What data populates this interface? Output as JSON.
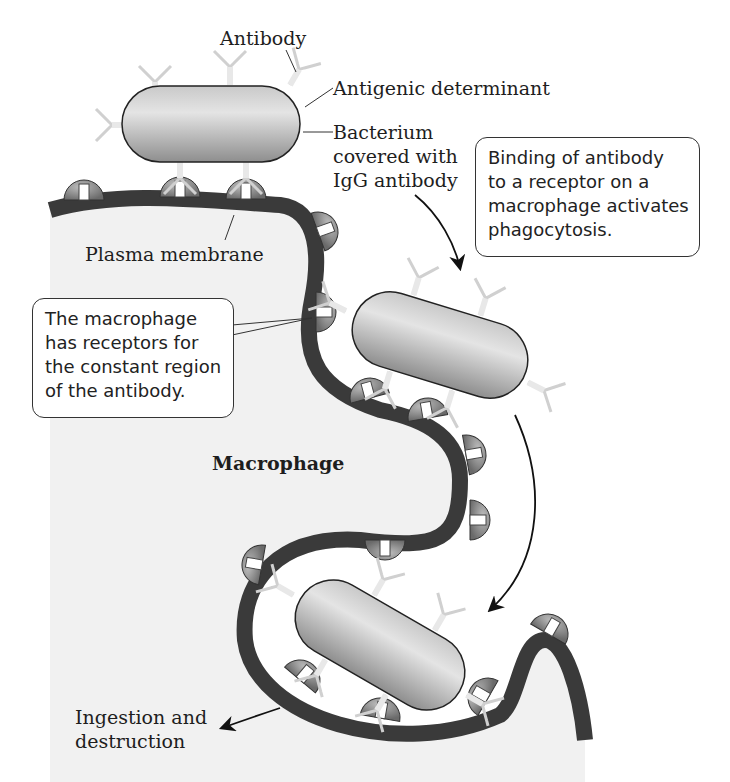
{
  "figure": {
    "labels": {
      "antibody": "Antibody",
      "antigenic_determinant": "Antigenic determinant",
      "bacterium": [
        "Bacterium",
        "covered with",
        "IgG antibody"
      ],
      "plasma_membrane": "Plasma membrane",
      "macrophage": "Macrophage",
      "ingestion": [
        "Ingestion and",
        "destruction"
      ]
    },
    "callouts": {
      "binding": [
        "Binding of antibody",
        "to a receptor on a",
        "macrophage activates",
        "phagocytosis."
      ],
      "receptors": [
        "The macrophage",
        "has receptors for",
        "the constant region",
        "of the antibody."
      ]
    },
    "colors": {
      "membrane": "#3a3a3a",
      "cytoplasm": "#f2f2f2",
      "bacterium": "#b5b5b5",
      "receptor": "#8a8a8a",
      "antibody": "#cfcfcf"
    }
  }
}
